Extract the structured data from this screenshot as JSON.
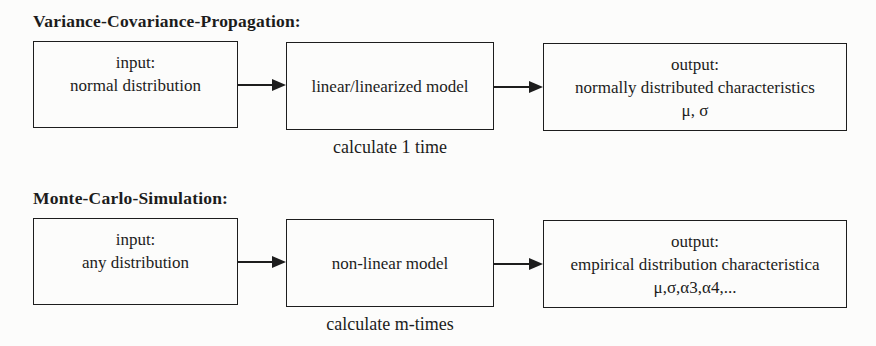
{
  "colors": {
    "background": "#fcfcfb",
    "ink": "#1c1c1c",
    "box_border": "#1d1d1d"
  },
  "diagrams": [
    {
      "title": "Variance-Covariance-Propagation:",
      "input_box": {
        "line1": "input:",
        "line2": "normal distribution"
      },
      "model_box": {
        "label": "linear/linearized model"
      },
      "model_caption": "calculate 1 time",
      "output_box": {
        "line1": "output:",
        "line2": "normally distributed characteristics",
        "line3": "μ, σ"
      }
    },
    {
      "title": "Monte-Carlo-Simulation:",
      "input_box": {
        "line1": "input:",
        "line2": "any distribution"
      },
      "model_box": {
        "label": "non-linear model"
      },
      "model_caption": "calculate m-times",
      "output_box": {
        "line1": "output:",
        "line2": "empirical distribution characteristica",
        "line3": "μ,σ,α3,α4,..."
      }
    }
  ]
}
